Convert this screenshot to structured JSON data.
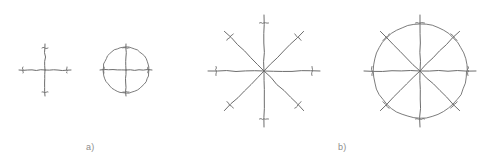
{
  "figure": {
    "title": "",
    "background_color": "#ffffff",
    "stroke_color": "#6d6d6d",
    "label_color": "#8d8d8d",
    "labels": [
      {
        "id": "a",
        "text": "a)",
        "x": 86,
        "y": 143
      },
      {
        "id": "b",
        "text": "b)",
        "x": 338,
        "y": 143
      }
    ],
    "groups": [
      {
        "id": "group-a",
        "label": "a)",
        "shapes": [
          {
            "name": "cross-4-spoke",
            "type": "spokes",
            "center": [
              45,
              70
            ],
            "spoke_count": 4,
            "spoke_length": 26,
            "angles_deg": [
              0,
              90,
              180,
              270
            ],
            "has_circle": false,
            "tick_marks": true,
            "tick_length": 6,
            "tick_offset": 4
          },
          {
            "name": "cross-4-spoke-in-circle",
            "type": "spokes",
            "center": [
              126,
              70
            ],
            "spoke_count": 4,
            "spoke_length": 26,
            "angles_deg": [
              0,
              90,
              180,
              270
            ],
            "has_circle": true,
            "circle_radius": 23,
            "tick_marks": true,
            "tick_length": 6,
            "tick_offset": 4
          }
        ]
      },
      {
        "id": "group-b",
        "label": "b)",
        "shapes": [
          {
            "name": "star-8-spoke",
            "type": "spokes",
            "center": [
              264,
              71
            ],
            "spoke_count": 8,
            "spoke_length": 56,
            "angles_deg": [
              0,
              45,
              90,
              135,
              180,
              225,
              270,
              315
            ],
            "has_circle": false,
            "tick_marks": true,
            "tick_length": 9,
            "tick_offset": 8
          },
          {
            "name": "star-8-spoke-in-circle",
            "type": "spokes",
            "center": [
              420,
              71
            ],
            "spoke_count": 8,
            "spoke_length": 56,
            "angles_deg": [
              0,
              45,
              90,
              135,
              180,
              225,
              270,
              315
            ],
            "has_circle": true,
            "circle_radius": 47,
            "tick_marks": true,
            "tick_length": 9,
            "tick_offset": 8
          }
        ]
      }
    ]
  }
}
